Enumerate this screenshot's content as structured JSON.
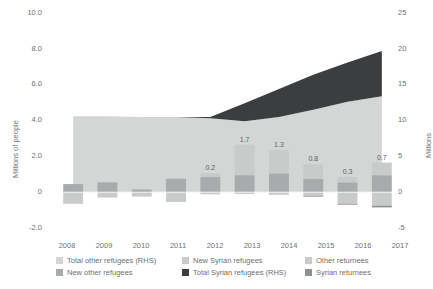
{
  "chart_data": {
    "type": "area",
    "title": "",
    "xlabel": "",
    "ylabel": "Millions of people",
    "ylabel_right": "Millions",
    "categories": [
      "2008",
      "2009",
      "2010",
      "2011",
      "2012",
      "2013",
      "2014",
      "2015",
      "2016",
      "2017"
    ],
    "ylim": [
      -2.0,
      10.0
    ],
    "ylim_right": [
      -5,
      25
    ],
    "yticks": [
      "10.0",
      "8.0",
      "6.0",
      "4.0",
      "2.0",
      "0",
      "-2.0"
    ],
    "yticks_right": [
      "25",
      "20",
      "15",
      "10",
      "5",
      "0",
      "-5"
    ],
    "grid": false,
    "legend_position": "bottom",
    "series": [
      {
        "name": "Total other refugees (RHS)",
        "type": "area",
        "axis": "right",
        "color": "#d4d6d6",
        "values": [
          10.6,
          10.6,
          10.5,
          10.5,
          10.3,
          9.9,
          10.5,
          11.5,
          12.6,
          13.4
        ]
      },
      {
        "name": "Total Syrian refugees (RHS)",
        "type": "area",
        "axis": "right",
        "color": "#3b3d3e",
        "values": [
          0.0,
          0.0,
          0.0,
          0.0,
          0.2,
          2.5,
          3.9,
          4.9,
          5.5,
          6.3
        ]
      },
      {
        "name": "New other refugees",
        "type": "bar",
        "axis": "left",
        "color": "#a8abab",
        "values": [
          0.45,
          0.55,
          0.15,
          0.75,
          0.85,
          0.95,
          1.05,
          0.75,
          0.55,
          0.95
        ]
      },
      {
        "name": "New Syrian refugees",
        "type": "bar",
        "axis": "left",
        "color": "#c9cbcb",
        "values": [
          0.0,
          0.0,
          0.0,
          0.0,
          0.2,
          1.7,
          1.3,
          0.8,
          0.3,
          0.7
        ]
      },
      {
        "name": "Other returnees",
        "type": "bar",
        "axis": "left",
        "color": "#c9cbcb",
        "values": [
          -0.65,
          -0.3,
          -0.25,
          -0.55,
          -0.12,
          -0.1,
          -0.15,
          -0.2,
          -0.65,
          -0.75
        ]
      },
      {
        "name": "Syrian returnees",
        "type": "bar",
        "axis": "left",
        "color": "#8e9192",
        "values": [
          0.0,
          0.0,
          0.0,
          0.0,
          0.0,
          0.0,
          0.0,
          -0.05,
          -0.05,
          -0.1
        ]
      }
    ],
    "bar_data_labels": [
      {
        "category": "2012",
        "text": "0.2"
      },
      {
        "category": "2013",
        "text": "1.7"
      },
      {
        "category": "2014",
        "text": "1.3"
      },
      {
        "category": "2015",
        "text": "0.8"
      },
      {
        "category": "2016",
        "text": "0.3"
      },
      {
        "category": "2017",
        "text": "0.7"
      }
    ]
  },
  "legend": {
    "items": [
      {
        "label": "Total other refugees (RHS)",
        "color": "#d4d6d6"
      },
      {
        "label": "New Syrian refugees",
        "color": "#c9cbcb"
      },
      {
        "label": "Other returnees",
        "color": "#c9cbcb"
      },
      {
        "label": "New other refugees",
        "color": "#a8abab"
      },
      {
        "label": "Total Syrian refugees (RHS)",
        "color": "#3b3d3e"
      },
      {
        "label": "Syrian returnees",
        "color": "#8e9192"
      }
    ]
  }
}
